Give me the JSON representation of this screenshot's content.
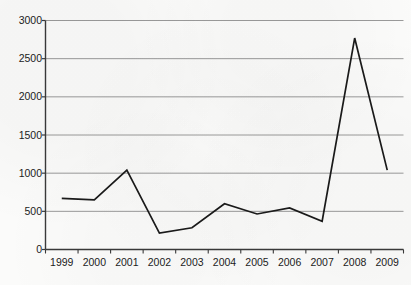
{
  "chart_data": {
    "type": "line",
    "title": "",
    "xlabel": "",
    "ylabel": "",
    "categories": [
      "1999",
      "2000",
      "2001",
      "2002",
      "2003",
      "2004",
      "2005",
      "2006",
      "2007",
      "2008",
      "2009"
    ],
    "values": [
      670,
      650,
      1040,
      215,
      285,
      600,
      465,
      545,
      370,
      2770,
      1040
    ],
    "series": [
      {
        "name": "",
        "values": [
          670,
          650,
          1040,
          215,
          285,
          600,
          465,
          545,
          370,
          2770,
          1040
        ]
      }
    ],
    "ylim": [
      0,
      3000
    ],
    "yticks": [
      0,
      500,
      1000,
      1500,
      2000,
      2500,
      3000
    ],
    "ytick_labels": [
      "0",
      "500",
      "1000",
      "1500",
      "2000",
      "2500",
      "3000"
    ],
    "xtick_labels": [
      "1999",
      "2000",
      "2001",
      "2002",
      "2003",
      "2004",
      "2005",
      "2006",
      "2007",
      "2008",
      "2009"
    ],
    "grid": "horizontal",
    "legend": "none",
    "line_color": "#1a1a1a",
    "grid_color": "#8e8e8e",
    "axis_color": "#3a3a3a",
    "background_color": "#fbfbfa"
  },
  "figure": {
    "cropped_title_text": ""
  }
}
